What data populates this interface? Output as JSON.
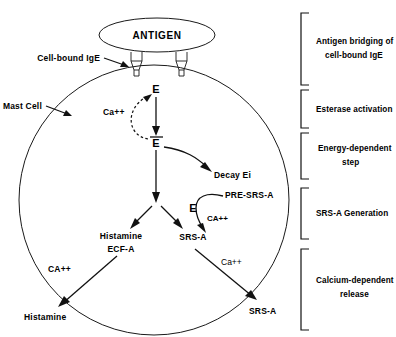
{
  "diagram": {
    "colors": {
      "ink": "#111111",
      "background": "#ffffff"
    },
    "antigen": {
      "label": "ANTIGEN"
    },
    "cell": {
      "label": "Mast Cell",
      "membrane_receptor_label": "Cell-bound IgE",
      "receptor_count": 2
    },
    "nodes": {
      "enzyme_inactive": "E",
      "enzyme_active": "E",
      "enzyme_active_bar": true,
      "calcium_activation": "Ca++",
      "decay": "Decay Ei",
      "histamine_intracellular_line1": "Histamine",
      "histamine_intracellular_line2": "ECF-A",
      "srs_a_intracellular": "SRS-A",
      "pre_srs_a": "PRE-SRS-A",
      "pre_srs_enzyme": "E",
      "pre_srs_calcium": "CA++",
      "release_calcium_left": "CA++",
      "release_calcium_right": "Ca++",
      "histamine_released": "Histamine",
      "srs_a_released": "SRS-A"
    },
    "stages": [
      {
        "id": "antigen-bridging",
        "line1": "Antigen bridging of",
        "line2": "cell-bound IgE"
      },
      {
        "id": "esterase-activation",
        "line1": "Esterase activation",
        "line2": ""
      },
      {
        "id": "energy-dependent-step",
        "line1": "Energy-dependent",
        "line2": "step"
      },
      {
        "id": "srs-a-generation",
        "line1": "SRS-A Generation",
        "line2": ""
      },
      {
        "id": "calcium-dependent-release",
        "line1": "Calcium-dependent",
        "line2": "release"
      }
    ]
  }
}
